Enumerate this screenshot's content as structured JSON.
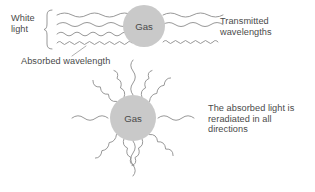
{
  "diagram": {
    "background": "#ffffff",
    "line_color": "#8c8c8c",
    "text_color": "#4a4a4a",
    "circle_fill": "#c9c9c9"
  },
  "labels": {
    "white_light": "White\nlight",
    "absorbed_wavelength": "Absorbed wavelength",
    "transmitted": "Transmitted\nwavelengths",
    "reradiated": "The absorbed light is\nreradiated in all\ndirections",
    "gas_top": "Gas",
    "gas_bottom": "Gas"
  },
  "scene_top": {
    "incoming_wave_count": 4,
    "transmitted_wave_count": 3,
    "absorbed_wave_index": 4,
    "gas_circle": {
      "cx": 144,
      "cy": 26,
      "r": 21
    }
  },
  "scene_bottom": {
    "radiating_ray_count": 12,
    "gas_circle": {
      "cx": 133,
      "cy": 118,
      "r": 23
    }
  }
}
